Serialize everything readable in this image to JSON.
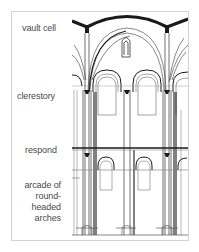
{
  "diagram": {
    "labels": {
      "vault_cell": "vault cell",
      "clerestory": "clerestory",
      "respond": "respond",
      "arcade": [
        "arcade of",
        "round-",
        "headed",
        "arches"
      ]
    },
    "colors": {
      "frame": "#d2d2d2",
      "label_text": "#4a4a4a",
      "line_dark": "#1a1a1a",
      "line_light": "#9a9a9a"
    }
  }
}
